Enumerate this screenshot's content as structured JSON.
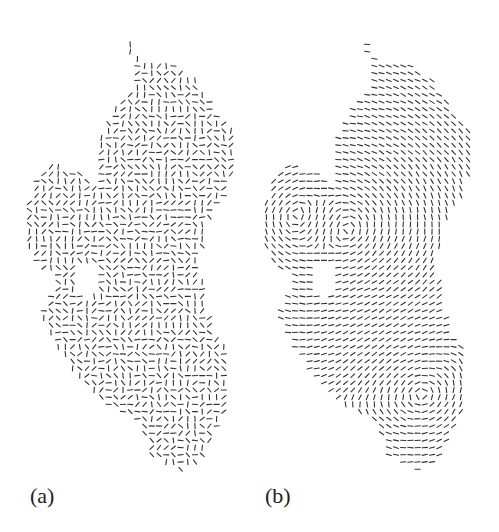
{
  "figure": {
    "panels": [
      {
        "id": "a",
        "label": "(a)",
        "offset_x": 0,
        "field": "random",
        "label_x": 30,
        "label_y": 483
      },
      {
        "id": "b",
        "label": "(b)",
        "offset_x": 237,
        "field": "smooth",
        "label_x": 265,
        "label_y": 483
      }
    ],
    "grid_spacing": 7.2,
    "segment_length": 5.2,
    "stroke_color": "#333333",
    "outline": [
      [
        127,
        35
      ],
      [
        138,
        55
      ],
      [
        140,
        66
      ],
      [
        175,
        62
      ],
      [
        200,
        85
      ],
      [
        215,
        110
      ],
      [
        232,
        132
      ],
      [
        233,
        175
      ],
      [
        222,
        200
      ],
      [
        206,
        225
      ],
      [
        200,
        262
      ],
      [
        205,
        300
      ],
      [
        215,
        330
      ],
      [
        228,
        352
      ],
      [
        230,
        400
      ],
      [
        215,
        432
      ],
      [
        200,
        462
      ],
      [
        180,
        470
      ],
      [
        150,
        455
      ],
      [
        140,
        420
      ],
      [
        100,
        402
      ],
      [
        75,
        372
      ],
      [
        55,
        342
      ],
      [
        40,
        318
      ],
      [
        50,
        292
      ],
      [
        60,
        278
      ],
      [
        40,
        270
      ],
      [
        28,
        250
      ],
      [
        25,
        215
      ],
      [
        34,
        178
      ],
      [
        50,
        165
      ],
      [
        72,
        168
      ],
      [
        98,
        186
      ],
      [
        100,
        140
      ],
      [
        112,
        112
      ],
      [
        132,
        92
      ],
      [
        138,
        70
      ],
      [
        124,
        40
      ]
    ],
    "notch_hole": [
      [
        75,
        268
      ],
      [
        92,
        258
      ],
      [
        98,
        282
      ],
      [
        92,
        300
      ],
      [
        80,
        296
      ]
    ]
  }
}
